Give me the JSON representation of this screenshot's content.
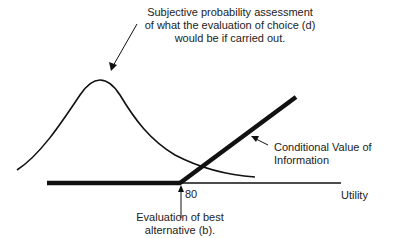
{
  "annotations": {
    "top_label": [
      "Subjective probability assessment",
      "of what the evaluation of choice (d)",
      "would be if carried out."
    ],
    "cvi_label": "Conditional Value of Information",
    "axis_label": "Utility",
    "tick_label": "80",
    "bottom_label": [
      "Evaluation of best",
      "alternative (b)."
    ]
  },
  "colors": {
    "line": "#111111",
    "text": "#222222",
    "background": "#ffffff"
  }
}
